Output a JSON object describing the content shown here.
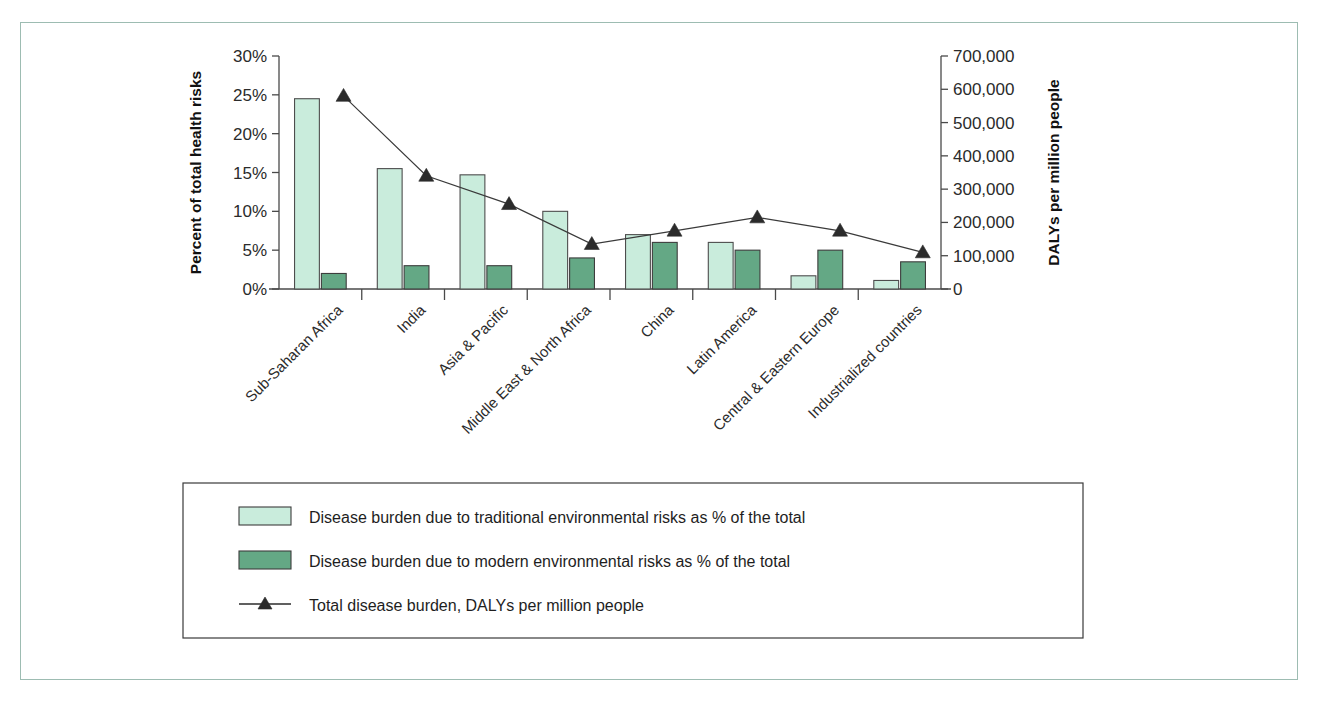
{
  "figure": {
    "frame_border_color": "#9dbcb2",
    "background": "#ffffff"
  },
  "chart_data": {
    "type": "bar",
    "title": "",
    "subtitle": "",
    "xlabel": "",
    "ylabel": "Percent of total health risks",
    "y2label": "DALYs per million people",
    "grid": false,
    "legend_position": "bottom",
    "categories": [
      "Sub-Saharan Africa",
      "India",
      "Asia & Pacific",
      "Middle East & North Africa",
      "China",
      "Latin America",
      "Central & Eastern Europe",
      "Industrialized countries"
    ],
    "ylim": [
      0,
      30
    ],
    "y2lim": [
      0,
      700000
    ],
    "yticks": [
      0,
      5,
      10,
      15,
      20,
      25,
      30
    ],
    "ytick_labels": [
      "0%",
      "5%",
      "10%",
      "15%",
      "20%",
      "25%",
      "30%"
    ],
    "y2ticks": [
      0,
      100000,
      200000,
      300000,
      400000,
      500000,
      600000,
      700000
    ],
    "y2tick_labels": [
      "0",
      "100,000",
      "200,000",
      "300,000",
      "400,000",
      "500,000",
      "600,000",
      "700,000"
    ],
    "series": [
      {
        "name": "Disease burden due to traditional environmental risks as % of the total",
        "type": "bar",
        "axis": "left",
        "color": "#c9ecdc",
        "values": [
          24.5,
          15.5,
          14.7,
          10.0,
          7.0,
          6.0,
          1.7,
          1.1
        ]
      },
      {
        "name": "Disease burden due to modern environmental risks as % of the total",
        "type": "bar",
        "axis": "left",
        "color": "#64a885",
        "values": [
          2.0,
          3.0,
          3.0,
          4.0,
          6.0,
          5.0,
          5.0,
          3.5
        ]
      },
      {
        "name": "Total disease burden, DALYs per million people",
        "type": "line",
        "axis": "right",
        "color": "#2b2b2b",
        "marker": "triangle",
        "values": [
          580000,
          340000,
          255000,
          135000,
          175000,
          215000,
          175000,
          110000
        ]
      }
    ]
  },
  "legend": {
    "items": [
      {
        "marker": "swatch-light",
        "label": "Disease burden due to traditional environmental risks as % of the total"
      },
      {
        "marker": "swatch-dark",
        "label": "Disease burden due to modern environmental risks as % of the total"
      },
      {
        "marker": "line-triangle",
        "label": "Total disease burden, DALYs per million people"
      }
    ]
  }
}
